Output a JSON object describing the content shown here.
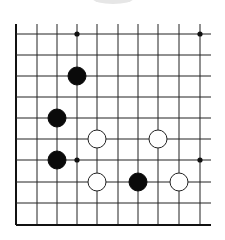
{
  "board": {
    "columns_x": [
      16,
      37,
      57,
      77,
      97,
      118,
      138,
      158,
      179,
      200
    ],
    "rows_y": [
      34,
      55,
      76,
      97,
      118,
      139,
      160,
      182,
      203,
      225
    ],
    "grid_top": 24,
    "grid_right": 211,
    "line_color": "#222222",
    "border_color": "#111111",
    "star_points": [
      [
        3,
        0
      ],
      [
        9,
        0
      ],
      [
        3,
        6
      ],
      [
        9,
        6
      ]
    ],
    "stone_radius": 9
  },
  "stones": [
    {
      "color": "black",
      "col": 3,
      "row": 2
    },
    {
      "color": "black",
      "col": 2,
      "row": 4
    },
    {
      "color": "white",
      "col": 4,
      "row": 5
    },
    {
      "color": "white",
      "col": 7,
      "row": 5
    },
    {
      "color": "black",
      "col": 2,
      "row": 6
    },
    {
      "color": "white",
      "col": 4,
      "row": 7
    },
    {
      "color": "black",
      "col": 6,
      "row": 7
    },
    {
      "color": "white",
      "col": 8,
      "row": 7
    }
  ]
}
